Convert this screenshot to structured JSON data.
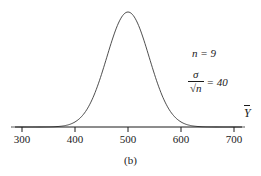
{
  "figure": {
    "caption": "(b)",
    "axis_variable_label": "Y",
    "annotations": {
      "sample_size": "n = 9",
      "se_numerator": "σ",
      "se_denominator": "√n",
      "se_equals": "= 40"
    }
  },
  "chart_data": {
    "type": "line",
    "title": "",
    "subtitle": "",
    "xlabel": "",
    "ylabel": "",
    "grid": false,
    "legend": null,
    "curve": "normal-density",
    "mean": 500,
    "standard_error": 40,
    "sample_size": 9,
    "xlim": [
      280,
      720
    ],
    "ylim": [
      0,
      1
    ],
    "xticks": [
      300,
      400,
      500,
      600,
      700
    ],
    "xticklabels": [
      "300",
      "400",
      "500",
      "600",
      "700"
    ],
    "yticks": [],
    "yticklabels": [],
    "x": [
      300,
      320,
      340,
      360,
      380,
      400,
      420,
      440,
      460,
      480,
      500,
      520,
      540,
      560,
      580,
      600,
      620,
      640,
      660,
      680,
      700
    ],
    "y": [
      0.0,
      0.0,
      0.0,
      0.001,
      0.007,
      0.044,
      0.175,
      0.458,
      0.79,
      0.969,
      1.0,
      0.969,
      0.79,
      0.458,
      0.175,
      0.044,
      0.007,
      0.001,
      0.0,
      0.0,
      0.0
    ],
    "annotations": [
      {
        "text": "n = 9",
        "x": 620,
        "y": 0.76
      },
      {
        "text": "σ/√n = 40",
        "x": 615,
        "y": 0.56
      }
    ]
  },
  "colors": {
    "curve": "#333333",
    "axis": "#1a1a1a",
    "text": "#1a1a1a",
    "background": "#ffffff"
  }
}
